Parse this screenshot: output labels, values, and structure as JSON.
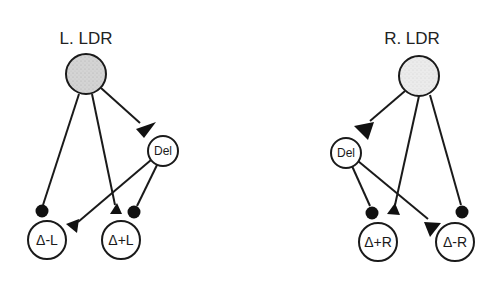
{
  "diagram": {
    "left": {
      "title": "L. LDR",
      "nodes": {
        "ldr": {
          "label": "",
          "fill": "#d9d9d9"
        },
        "del": {
          "label": "Del"
        },
        "minus": {
          "label": "Δ-L"
        },
        "plus": {
          "label": "Δ+L"
        }
      },
      "edges": [
        {
          "from": "L. LDR",
          "to": "Del",
          "terminal": "triangle"
        },
        {
          "from": "L. LDR",
          "to": "Δ-L",
          "terminal": "dot"
        },
        {
          "from": "L. LDR",
          "to": "Δ+L",
          "terminal": "triangle"
        },
        {
          "from": "Del",
          "to": "Δ-L",
          "terminal": "triangle"
        },
        {
          "from": "Del",
          "to": "Δ+L",
          "terminal": "dot"
        }
      ]
    },
    "right": {
      "title": "R. LDR",
      "nodes": {
        "ldr": {
          "label": "",
          "fill": "#e6e6e6"
        },
        "del": {
          "label": "Del"
        },
        "plus": {
          "label": "Δ+R"
        },
        "minus": {
          "label": "Δ-R"
        }
      },
      "edges": [
        {
          "from": "R. LDR",
          "to": "Del",
          "terminal": "triangle"
        },
        {
          "from": "R. LDR",
          "to": "Δ+R",
          "terminal": "triangle"
        },
        {
          "from": "R. LDR",
          "to": "Δ-R",
          "terminal": "dot"
        },
        {
          "from": "Del",
          "to": "Δ+R",
          "terminal": "dot"
        },
        {
          "from": "Del",
          "to": "Δ-R",
          "terminal": "triangle"
        }
      ]
    },
    "legend": {
      "triangle_terminal": "excitatory",
      "dot_terminal": "inhibitory"
    }
  }
}
